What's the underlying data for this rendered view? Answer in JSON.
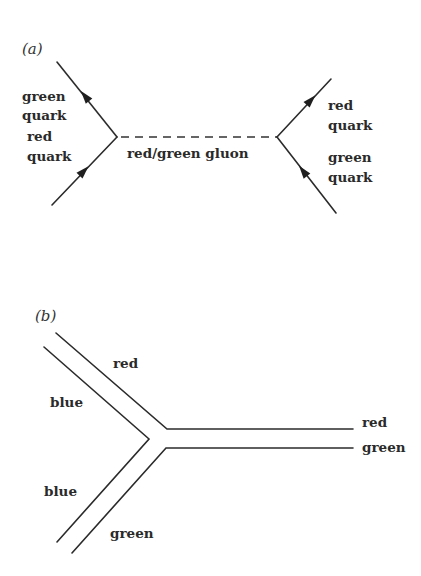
{
  "figure": {
    "panel_a": {
      "label": "(a)",
      "label_pos": [
        22,
        54
      ],
      "lines": [
        {
          "name": "outgoing-green-quark-line",
          "from": [
            117,
            137
          ],
          "to": [
            57,
            62
          ]
        },
        {
          "name": "incoming-red-quark-line",
          "from": [
            52,
            205
          ],
          "to": [
            117,
            137
          ]
        },
        {
          "name": "outgoing-red-quark-line",
          "from": [
            277,
            137
          ],
          "to": [
            331,
            79
          ]
        },
        {
          "name": "incoming-green-quark-line",
          "from": [
            336,
            213
          ],
          "to": [
            277,
            137
          ]
        }
      ],
      "gluon": {
        "name": "gluon-dashed-line",
        "from": [
          117,
          137
        ],
        "to": [
          277,
          137
        ]
      },
      "arrows": [
        {
          "name": "arrow-up-left-icon",
          "at": [
            85,
            96
          ],
          "dir": [
            -60,
            -75
          ]
        },
        {
          "name": "arrow-up-right-icon",
          "at": [
            84,
            171
          ],
          "dir": [
            65,
            -68
          ]
        },
        {
          "name": "arrow-up-right-icon",
          "at": [
            311,
            100
          ],
          "dir": [
            54,
            -58
          ]
        },
        {
          "name": "arrow-up-left-icon",
          "at": [
            303,
            171
          ],
          "dir": [
            -59,
            -76
          ]
        }
      ],
      "labels": [
        {
          "name": "label-green-quark-top",
          "text": "green",
          "pos": [
            22,
            101
          ]
        },
        {
          "name": "label-green-quark-top-2",
          "text": "quark",
          "pos": [
            22,
            120
          ]
        },
        {
          "name": "label-red-quark-left",
          "text": "red",
          "pos": [
            27,
            141
          ]
        },
        {
          "name": "label-red-quark-left-2",
          "text": "quark",
          "pos": [
            27,
            161
          ]
        },
        {
          "name": "label-gluon",
          "text": "red/green gluon",
          "pos": [
            127,
            158
          ]
        },
        {
          "name": "label-red-quark-right",
          "text": "red",
          "pos": [
            328,
            110
          ]
        },
        {
          "name": "label-red-quark-right-2",
          "text": "quark",
          "pos": [
            328,
            130
          ]
        },
        {
          "name": "label-green-quark-right",
          "text": "green",
          "pos": [
            328,
            162
          ]
        },
        {
          "name": "label-green-quark-right-2",
          "text": "quark",
          "pos": [
            328,
            182
          ]
        }
      ]
    },
    "panel_b": {
      "label": "(b)",
      "label_pos": [
        35,
        321
      ],
      "lines": [
        {
          "name": "red-color-line",
          "points": [
            [
              56,
              333
            ],
            [
              167,
              429
            ],
            [
              353,
              429
            ]
          ]
        },
        {
          "name": "blue-color-line",
          "points": [
            [
              44,
              347
            ],
            [
              149,
              439
            ],
            [
              57,
              542
            ]
          ]
        },
        {
          "name": "green-color-line",
          "points": [
            [
              72,
              553
            ],
            [
              166,
              448
            ],
            [
              353,
              448
            ]
          ]
        }
      ],
      "labels": [
        {
          "name": "label-red-upper",
          "text": "red",
          "pos": [
            113,
            368
          ]
        },
        {
          "name": "label-blue-upper",
          "text": "blue",
          "pos": [
            50,
            407
          ]
        },
        {
          "name": "label-blue-lower",
          "text": "blue",
          "pos": [
            44,
            496
          ]
        },
        {
          "name": "label-green-lower",
          "text": "green",
          "pos": [
            110,
            538
          ]
        },
        {
          "name": "label-red-right",
          "text": "red",
          "pos": [
            362,
            427
          ]
        },
        {
          "name": "label-green-right",
          "text": "green",
          "pos": [
            362,
            452
          ]
        }
      ]
    }
  }
}
